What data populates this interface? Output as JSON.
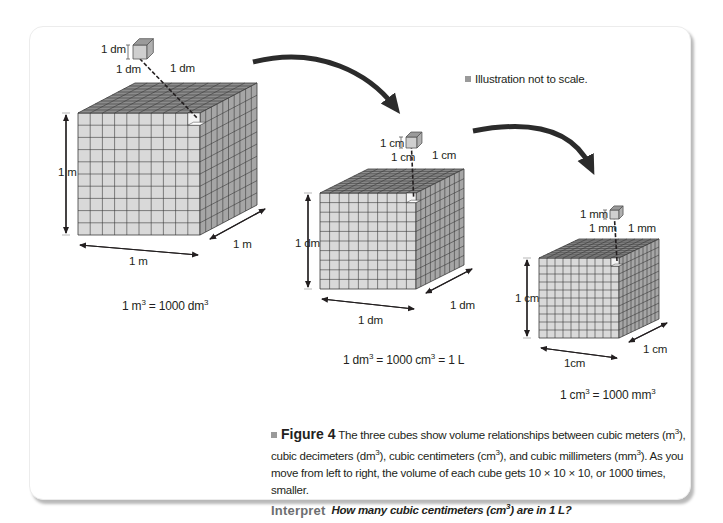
{
  "figure": {
    "note": "Illustration not to scale.",
    "cubes": [
      {
        "id": "cubic-meter",
        "small_cube_labels": {
          "height": "1 dm",
          "width": "1 dm",
          "depth": "1 dm"
        },
        "dimension_labels": {
          "height": "1 m",
          "width": "1 m",
          "depth": "1 m"
        },
        "equation": {
          "lhs": "1 m",
          "lhs_exp": "3",
          "rhs": "= 1000 dm",
          "rhs_exp": "3",
          "tail": ""
        }
      },
      {
        "id": "cubic-decimeter",
        "small_cube_labels": {
          "height": "1 cm",
          "width": "1 cm",
          "depth": "1 cm"
        },
        "dimension_labels": {
          "height": "1 dm",
          "width": "1 dm",
          "depth": "1 dm"
        },
        "equation": {
          "lhs": "1 dm",
          "lhs_exp": "3",
          "mid": "= 1000 cm",
          "mid_exp": "3",
          "tail": "= 1 L"
        }
      },
      {
        "id": "cubic-centimeter",
        "small_cube_labels": {
          "height": "1 mm",
          "width": "1 mm",
          "depth": "1 mm"
        },
        "dimension_labels": {
          "height": "1 cm",
          "width": "1cm",
          "depth": "1 cm"
        },
        "equation": {
          "lhs": "1 cm",
          "lhs_exp": "3",
          "rhs": "= 1000 mm",
          "rhs_exp": "3",
          "tail": ""
        }
      }
    ],
    "grid_divisions": 10,
    "colors": {
      "face_front": "#d9d9d9",
      "face_top": "#8c8c8c",
      "face_side": "#a6a6a6",
      "grid_line": "#3a3a3a",
      "arrow": "#2b2b2b",
      "bullet": "#9a9a9a",
      "interpret": "#6d6e70"
    }
  },
  "caption": {
    "figure_label": "Figure 4",
    "text_1": " The three cubes show volume relationships between cubic meters (m",
    "text_2": "), cubic decimeters (dm",
    "text_3": "), cubic centimeters (cm",
    "text_4": "), and cubic millimeters (mm",
    "text_5": "). As you move from left to right, the volume of each cube gets 10 × 10 × 10, or 1000 times, smaller.",
    "exp": "3",
    "interpret_label": "Interpret",
    "question_1": "How many cubic centimeters (cm",
    "question_2": ") are in 1 L?"
  }
}
